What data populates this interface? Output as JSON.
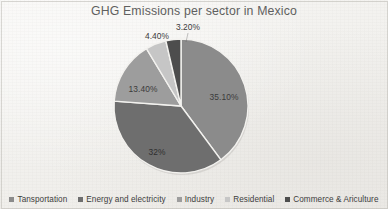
{
  "chart_data": {
    "type": "pie",
    "title": "GHG Emissions per sector in Mexico",
    "xlabel": "",
    "ylabel": "",
    "legend_position": "bottom",
    "grid": false,
    "start_angle_deg": 0,
    "direction": "clockwise",
    "categories": [
      "Tansportation",
      "Energy and electricity",
      "Industry",
      "Residential",
      "Commerce & Ariculture"
    ],
    "values": [
      35.1,
      32.0,
      13.4,
      4.4,
      3.2
    ],
    "value_labels": [
      "35.10%",
      "32%",
      "13.40%",
      "4.40%",
      "3.20%"
    ],
    "colors": [
      "#8b8b8b",
      "#6e6e6e",
      "#9d9d9d",
      "#c6c6c6",
      "#4d4d4d"
    ],
    "slices": [
      {
        "name": "Tansportation",
        "value": 35.1,
        "label": "35.10%",
        "color": "#8b8b8b",
        "label_x": 224,
        "label_y": 97,
        "label_on_dark": false
      },
      {
        "name": "Energy and electricity",
        "value": 32.0,
        "label": "32%",
        "color": "#6e6e6e",
        "label_x": 157,
        "label_y": 152,
        "label_on_dark": true
      },
      {
        "name": "Industry",
        "value": 13.4,
        "label": "13.40%",
        "color": "#9d9d9d",
        "label_x": 143,
        "label_y": 89,
        "label_on_dark": false
      },
      {
        "name": "Residential",
        "value": 4.4,
        "label": "4.40%",
        "color": "#c6c6c6",
        "label_x": 157,
        "label_y": 36,
        "label_on_dark": false
      },
      {
        "name": "Commerce & Ariculture",
        "value": 3.2,
        "label": "3.20%",
        "color": "#4d4d4d",
        "label_x": 188,
        "label_y": 27,
        "label_on_dark": false
      }
    ]
  },
  "title": "GHG Emissions per sector in Mexico",
  "legend": {
    "items": [
      {
        "label": "Tansportation",
        "color": "#8b8b8b"
      },
      {
        "label": "Energy and electricity",
        "color": "#6e6e6e"
      },
      {
        "label": "Industry",
        "color": "#9d9d9d"
      },
      {
        "label": "Residential",
        "color": "#c6c6c6"
      },
      {
        "label": "Commerce & Ariculture",
        "color": "#4d4d4d"
      }
    ]
  }
}
